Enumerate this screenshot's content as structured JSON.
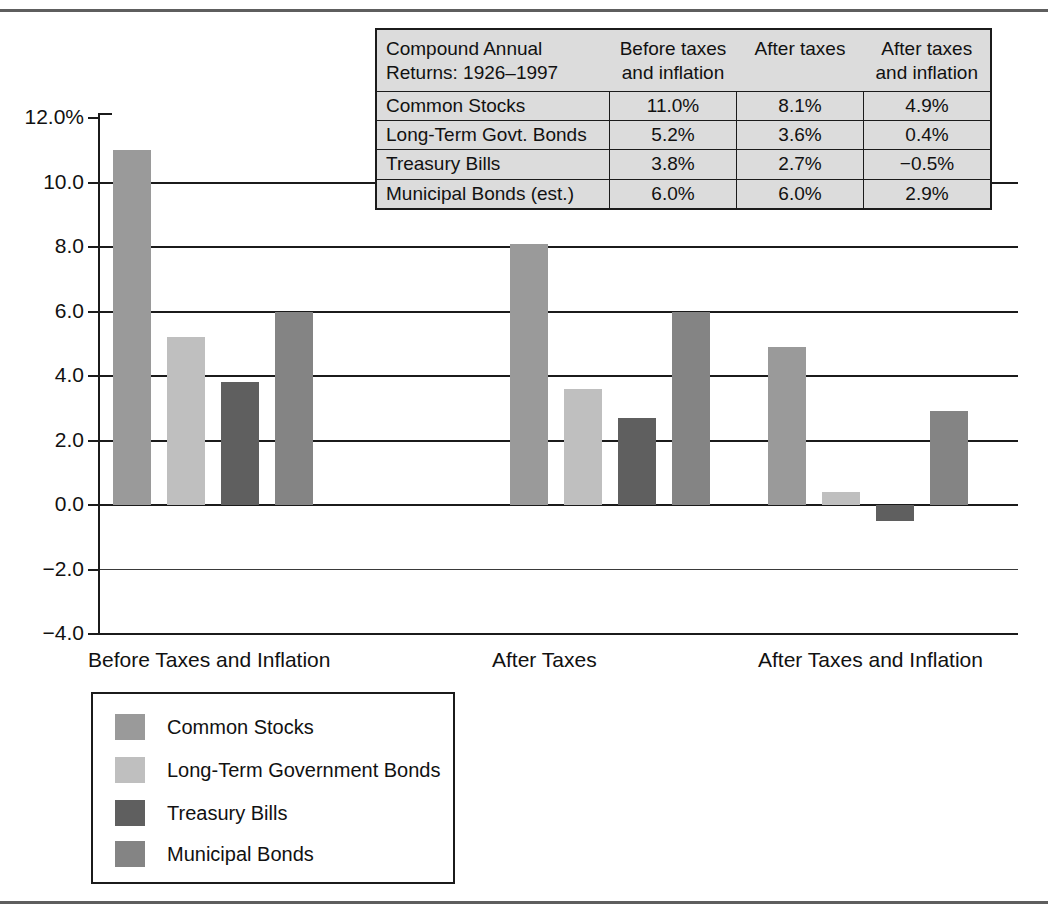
{
  "chart_data": {
    "type": "bar",
    "title": "",
    "xlabel": "",
    "ylabel": "",
    "ylim": [
      -4.0,
      12.0
    ],
    "grid": true,
    "legend_position": "bottom-left",
    "y_ticks": [
      "12.0%",
      "10.0",
      "8.0",
      "6.0",
      "4.0",
      "2.0",
      "0.0",
      "−2.0",
      "−4.0"
    ],
    "y_tick_values": [
      12.0,
      10.0,
      8.0,
      6.0,
      4.0,
      2.0,
      0.0,
      -2.0,
      -4.0
    ],
    "categories": [
      "Before Taxes and Inflation",
      "After Taxes",
      "After Taxes and Inflation"
    ],
    "series": [
      {
        "name": "Common Stocks",
        "color": "#9a9a9a",
        "values": [
          11.0,
          8.1,
          4.9
        ]
      },
      {
        "name": "Long-Term Government Bonds",
        "color": "#bfbfbf",
        "values": [
          5.2,
          3.6,
          0.4
        ]
      },
      {
        "name": "Treasury Bills",
        "color": "#5f5f5f",
        "values": [
          3.8,
          2.7,
          -0.5
        ]
      },
      {
        "name": "Municipal Bonds",
        "color": "#848484",
        "values": [
          6.0,
          6.0,
          2.9
        ]
      }
    ]
  },
  "table": {
    "header": {
      "corner": "Compound Annual\nReturns: 1926–1997",
      "columns": [
        "Before taxes\nand inflation",
        "After taxes",
        "After taxes\nand inflation"
      ]
    },
    "rows": [
      {
        "label": "Common Stocks",
        "values": [
          "11.0%",
          "8.1%",
          "4.9%"
        ]
      },
      {
        "label": "Long-Term Govt. Bonds",
        "values": [
          "5.2%",
          "3.6%",
          "0.4%"
        ]
      },
      {
        "label": "Treasury Bills",
        "values": [
          "3.8%",
          "2.7%",
          "−0.5%"
        ]
      },
      {
        "label": "Municipal Bonds (est.)",
        "values": [
          "6.0%",
          "6.0%",
          "2.9%"
        ]
      }
    ]
  },
  "legend": {
    "items": [
      {
        "label": "Common Stocks",
        "color": "#9a9a9a"
      },
      {
        "label": "Long-Term Government Bonds",
        "color": "#bfbfbf"
      },
      {
        "label": "Treasury Bills",
        "color": "#5f5f5f"
      },
      {
        "label": "Municipal Bonds",
        "color": "#848484"
      }
    ]
  }
}
